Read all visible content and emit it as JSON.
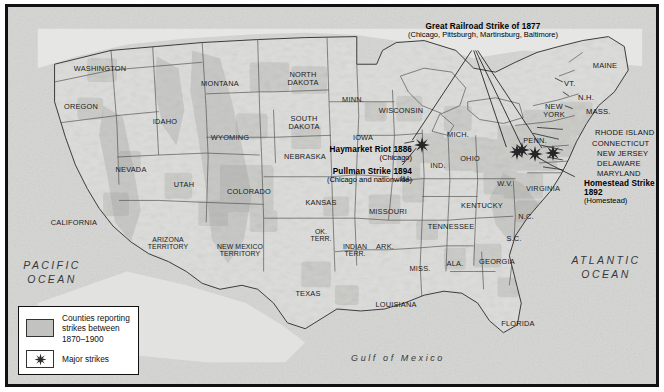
{
  "figure": {
    "kind": "historical-thematic-map"
  },
  "oceans": [
    {
      "name": "pacific-ocean",
      "label": "PACIFIC\nOCEAN",
      "line1": "PACIFIC",
      "line2": "OCEAN",
      "x": 44,
      "y": 265
    },
    {
      "name": "atlantic-ocean",
      "label": "ATLANTIC\nOCEAN",
      "line1": "ATLANTIC",
      "line2": "OCEAN",
      "x": 598,
      "y": 260
    },
    {
      "name": "gulf-of-mexico",
      "line1": "Gulf of Mexico",
      "x": 390,
      "y": 352
    }
  ],
  "states": [
    {
      "label": "WASHINGTON",
      "x": 92,
      "y": 62,
      "size": "sm"
    },
    {
      "label": "OREGON",
      "x": 73,
      "y": 100,
      "size": "sm"
    },
    {
      "label": "IDAHO",
      "x": 157,
      "y": 115,
      "size": "sm"
    },
    {
      "label": "MONTANA",
      "x": 212,
      "y": 77,
      "size": "sm"
    },
    {
      "label": "NORTH\nDAKOTA",
      "x": 295,
      "y": 72,
      "size": "sm",
      "l1": "NORTH",
      "l2": "DAKOTA"
    },
    {
      "label": "SOUTH\nDAKOTA",
      "x": 296,
      "y": 116,
      "size": "sm",
      "l1": "SOUTH",
      "l2": "DAKOTA"
    },
    {
      "label": "MINN.",
      "x": 345,
      "y": 93,
      "size": "sm"
    },
    {
      "label": "WISCONSIN",
      "x": 393,
      "y": 104,
      "size": "sm"
    },
    {
      "label": "WYOMING",
      "x": 222,
      "y": 131,
      "size": "sm"
    },
    {
      "label": "NEVADA",
      "x": 123,
      "y": 163,
      "size": "sm"
    },
    {
      "label": "UTAH",
      "x": 176,
      "y": 178,
      "size": "sm"
    },
    {
      "label": "COLORADO",
      "x": 241,
      "y": 185,
      "size": "sm"
    },
    {
      "label": "NEBRASKA",
      "x": 297,
      "y": 150,
      "size": "sm"
    },
    {
      "label": "IOWA",
      "x": 355,
      "y": 131,
      "size": "sm"
    },
    {
      "label": "KANSAS",
      "x": 313,
      "y": 196,
      "size": "sm"
    },
    {
      "label": "MISSOURI",
      "x": 380,
      "y": 205,
      "size": "sm"
    },
    {
      "label": "ILL.",
      "x": 399,
      "y": 172,
      "size": "sm"
    },
    {
      "label": "IND.",
      "x": 430,
      "y": 159,
      "size": "sm"
    },
    {
      "label": "MICH.",
      "x": 450,
      "y": 128,
      "size": "sm"
    },
    {
      "label": "OHIO",
      "x": 462,
      "y": 152,
      "size": "sm"
    },
    {
      "label": "PENN.",
      "x": 527,
      "y": 134,
      "size": "sm"
    },
    {
      "label": "NEW\nYORK",
      "x": 546,
      "y": 104,
      "size": "sm",
      "l1": "NEW",
      "l2": "YORK"
    },
    {
      "label": "W.V.",
      "x": 497,
      "y": 177,
      "size": "sm"
    },
    {
      "label": "VIRGINIA",
      "x": 535,
      "y": 182,
      "size": "sm"
    },
    {
      "label": "KENTUCKY",
      "x": 474,
      "y": 199,
      "size": "sm"
    },
    {
      "label": "TENNESSEE",
      "x": 443,
      "y": 220,
      "size": "sm"
    },
    {
      "label": "N.C.",
      "x": 518,
      "y": 210,
      "size": "sm"
    },
    {
      "label": "S.C.",
      "x": 506,
      "y": 232,
      "size": "sm"
    },
    {
      "label": "GEORGIA",
      "x": 489,
      "y": 255,
      "size": "sm"
    },
    {
      "label": "ALA.",
      "x": 447,
      "y": 257,
      "size": "sm"
    },
    {
      "label": "MISS.",
      "x": 412,
      "y": 262,
      "size": "sm"
    },
    {
      "label": "ARK.",
      "x": 377,
      "y": 240,
      "size": "sm"
    },
    {
      "label": "LOUISIANA",
      "x": 388,
      "y": 298,
      "size": "sm"
    },
    {
      "label": "FLORIDA",
      "x": 510,
      "y": 317,
      "size": "sm"
    },
    {
      "label": "TEXAS",
      "x": 300,
      "y": 287,
      "size": "sm"
    },
    {
      "label": "OK.\nTERR.",
      "x": 313,
      "y": 228,
      "size": "xs",
      "l1": "OK.",
      "l2": "TERR."
    },
    {
      "label": "INDIAN\nTERR.",
      "x": 347,
      "y": 243,
      "size": "xs",
      "l1": "INDIAN",
      "l2": "TERR."
    },
    {
      "label": "ARIZONA\nTERRITORY",
      "x": 160,
      "y": 236,
      "size": "xs",
      "l1": "ARIZONA",
      "l2": "TERRITORY"
    },
    {
      "label": "NEW MEXICO\nTERRITORY",
      "x": 232,
      "y": 243,
      "size": "xs",
      "l1": "NEW MEXICO",
      "l2": "TERRITORY"
    },
    {
      "label": "CALIFORNIA",
      "x": 66,
      "y": 216,
      "size": "sm"
    },
    {
      "label": "MAINE",
      "x": 597,
      "y": 59,
      "size": "sm"
    }
  ],
  "coastal_states": [
    {
      "label": "VT.",
      "x": 556,
      "y": 76,
      "name": "vermont"
    },
    {
      "label": "N.H.",
      "x": 570,
      "y": 90,
      "name": "new-hampshire"
    },
    {
      "label": "MASS.",
      "x": 578,
      "y": 104,
      "name": "massachusetts"
    },
    {
      "label": "RHODE ISLAND",
      "x": 587,
      "y": 125,
      "name": "rhode-island"
    },
    {
      "label": "CONNECTICUT",
      "x": 584,
      "y": 136,
      "name": "connecticut"
    },
    {
      "label": "NEW JERSEY",
      "x": 589,
      "y": 146,
      "name": "new-jersey"
    },
    {
      "label": "DELAWARE",
      "x": 589,
      "y": 156,
      "name": "delaware"
    },
    {
      "label": "MARYLAND",
      "x": 589,
      "y": 166,
      "name": "maryland"
    }
  ],
  "annotations": [
    {
      "name": "great-railroad-strike-1877",
      "title": "Great Railroad Strike of 1877",
      "detail": "(Chicago, Pittsburgh, Martinsburg, Baltimore)",
      "x": 475,
      "y": 22,
      "align": "ctr"
    },
    {
      "name": "haymarket-riot-1886",
      "title": "Haymarket Riot 1886",
      "detail": "(Chicago)",
      "x": 404,
      "y": 143,
      "align": "rt"
    },
    {
      "name": "pullman-strike-1894",
      "title": "Pullman Strike 1894",
      "detail": "(Chicago and nationwide)",
      "x": 404,
      "y": 164,
      "align": "rt"
    },
    {
      "name": "homestead-strike-1892",
      "title": "Homestead Strike",
      "title2": "1892",
      "detail": "(Homestead)",
      "x": 576,
      "y": 178,
      "align": "lt"
    }
  ],
  "major_strike_markers": [
    {
      "name": "chicago",
      "x": 414,
      "y": 140
    },
    {
      "name": "pittsburgh",
      "x": 509,
      "y": 147
    },
    {
      "name": "martinsburg",
      "x": 527,
      "y": 149
    },
    {
      "name": "baltimore",
      "x": 545,
      "y": 148
    },
    {
      "name": "homestead",
      "x": 514,
      "y": 145
    }
  ],
  "legend": {
    "name": "map-legend",
    "items": [
      {
        "symbol": "shaded-county-swatch",
        "text": "Counties reporting\nstrikes between\n1870–1900",
        "line1": "Counties reporting",
        "line2": "strikes between",
        "line3": "1870–1900"
      },
      {
        "symbol": "star-marker",
        "text": "Major strikes",
        "line1": "Major strikes"
      }
    ]
  },
  "colors": {
    "ocean": "#d9d9d7",
    "land": "#ececea",
    "shaded_county": "#c2c2c0",
    "border": "#111111",
    "state_line": "#5a5a5a",
    "text": "#1a1a1a"
  }
}
